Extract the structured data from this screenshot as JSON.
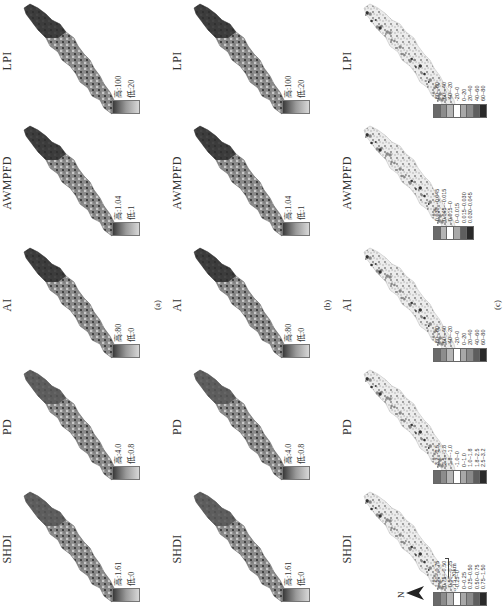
{
  "figure": {
    "north_label": "N",
    "scale_label": "0 5 10 15 20km",
    "metrics": [
      "SHDI",
      "PD",
      "AI",
      "AWMPFD",
      "LPI"
    ],
    "panels": [
      {
        "label": "(a)",
        "kind": "continuous",
        "maps": [
          {
            "title": "SHDI",
            "high": "高:1.61",
            "low": "低:0"
          },
          {
            "title": "PD",
            "high": "高:4.0",
            "low": "低:0.8"
          },
          {
            "title": "AI",
            "high": "高:80",
            "low": "低:0"
          },
          {
            "title": "AWMPFD",
            "high": "高:1.04",
            "low": "低:1"
          },
          {
            "title": "LPI",
            "high": "高:100",
            "low": "低:20"
          }
        ]
      },
      {
        "label": "(b)",
        "kind": "continuous",
        "maps": [
          {
            "title": "SHDI",
            "high": "高:1.61",
            "low": "低:0"
          },
          {
            "title": "PD",
            "high": "高:4.0",
            "low": "低:0.8"
          },
          {
            "title": "AI",
            "high": "高:80",
            "low": "低:0"
          },
          {
            "title": "AWMPFD",
            "high": "高:1.04",
            "low": "低:1"
          },
          {
            "title": "LPI",
            "high": "高:100",
            "low": "低:20"
          }
        ]
      },
      {
        "label": "(c)",
        "kind": "classified",
        "maps": [
          {
            "title": "SHDI",
            "classes": [
              "-1.50~-0.75",
              "-0.75~-0.50",
              "-0.50~-0.25",
              "-0.25~0",
              "0~0.25",
              "0.25~0.50",
              "0.50~0.75",
              "0.75~1.50"
            ]
          },
          {
            "title": "PD",
            "classes": [
              "-3.2~-2.5",
              "-2.5~-1.8",
              "-1.8~-1.0",
              "-1.0~0",
              "0~1.0",
              "1.0~1.8",
              "1.8~2.5",
              "2.5~3.2"
            ]
          },
          {
            "title": "AI",
            "classes": [
              "-80~-60",
              "-60~-40",
              "-40~-20",
              "-20~0",
              "0~20",
              "20~40",
              "40~60",
              "60~80"
            ]
          },
          {
            "title": "AWMPFD",
            "classes": [
              "-0.030~-0.045",
              "-0.045~-0.015",
              "-0.015~0",
              "0~0.015",
              "0.015~0.030",
              "0.030~0.045"
            ]
          },
          {
            "title": "LPI",
            "classes": [
              "-80~-60",
              "-60~-40",
              "-40~-20",
              "-20~0",
              "0~20",
              "20~40",
              "40~60",
              "60~80"
            ]
          }
        ]
      }
    ],
    "colors": {
      "map_dark": "#2e2e2e",
      "map_mid": "#8a8a8a",
      "map_light": "#c8c8c8",
      "change_bg": "#ececec",
      "class_swatches": [
        "#6a6a6a",
        "#8c8c8c",
        "#b4b4b4",
        "#ffffff",
        "#a8a8a8",
        "#8a8a8a",
        "#5e5e5e",
        "#2a2a2a"
      ]
    }
  }
}
